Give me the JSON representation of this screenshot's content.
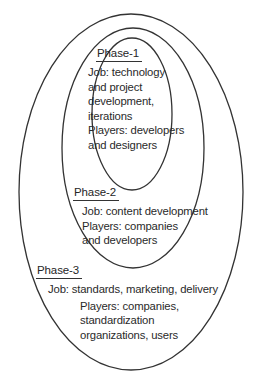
{
  "diagram": {
    "type": "nested-ellipse-venn",
    "title": "",
    "background_color": "#ffffff",
    "stroke_color": "#333333",
    "text_color": "#2a2a2a",
    "rings": [
      {
        "name": "inner-ellipse",
        "phase_ref": "phase-1",
        "cx": 132,
        "cy": 114,
        "rx": 40,
        "ry": 76
      },
      {
        "name": "middle-ellipse",
        "phase_ref": "phase-2",
        "cx": 133,
        "cy": 148,
        "rx": 71,
        "ry": 120
      },
      {
        "name": "outer-ellipse",
        "phase_ref": "phase-3",
        "cx": 131,
        "cy": 192,
        "rx": 112,
        "ry": 178
      }
    ],
    "phases": [
      {
        "id": "phase-1",
        "heading": "Phase-1",
        "lines": [
          "Job: technology",
          "and project",
          "development,",
          "iterations",
          "Players: developers",
          "and designers"
        ]
      },
      {
        "id": "phase-2",
        "heading": "Phase-2",
        "lines": [
          "Job: content development",
          "Players: companies",
          "and developers"
        ]
      },
      {
        "id": "phase-3",
        "heading": "Phase-3",
        "job_line": "Job: standards, marketing, delivery",
        "players_lines": [
          "Players: companies,",
          "standardization",
          "organizations, users"
        ]
      }
    ]
  }
}
